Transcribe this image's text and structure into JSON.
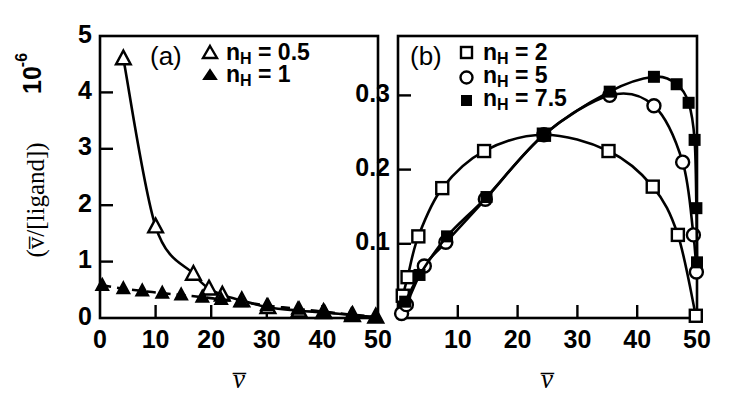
{
  "figure": {
    "background": "#ffffff",
    "ink_color": "#000000",
    "width": 733,
    "height": 418
  },
  "shared": {
    "xlabel": "v̅",
    "ylabel_main": "(v̅/[ligand])",
    "ylabel_exponent_base": "10",
    "ylabel_exponent_power": "-6",
    "nh_symbol_base": "n",
    "nh_symbol_sub": "H",
    "equals": "="
  },
  "chart_data": [
    {
      "type": "scatter",
      "panel": "a",
      "panel_label": "(a)",
      "title": "",
      "xlabel": "v̅",
      "ylabel": "(v̅/[ligand]) 10⁻⁶",
      "xlim": [
        0,
        50
      ],
      "ylim": [
        0,
        5
      ],
      "xticks": [
        0,
        10,
        20,
        30,
        40,
        50
      ],
      "xticklabels": [
        "0",
        "10",
        "20",
        "30",
        "40",
        "50"
      ],
      "yticks": [
        0,
        1,
        2,
        3,
        4,
        5
      ],
      "yticklabels": [
        "0",
        "1",
        "2",
        "3",
        "4",
        "5"
      ],
      "grid": false,
      "legend_position": "top-center",
      "series": [
        {
          "name": "n_H = 0.5",
          "legend_label": "n_H = 0.5",
          "nh_value": "0.5",
          "marker": "triangle-open",
          "line": "solid",
          "points": [
            {
              "x": 4.2,
              "y": 4.6
            },
            {
              "x": 10.0,
              "y": 1.62
            },
            {
              "x": 16.8,
              "y": 0.78
            },
            {
              "x": 19.6,
              "y": 0.52
            },
            {
              "x": 22.0,
              "y": 0.41
            },
            {
              "x": 25.5,
              "y": 0.31
            },
            {
              "x": 30.2,
              "y": 0.19
            },
            {
              "x": 35.8,
              "y": 0.13
            },
            {
              "x": 40.2,
              "y": 0.1
            },
            {
              "x": 45.4,
              "y": 0.05
            },
            {
              "x": 49.6,
              "y": 0.02
            }
          ]
        },
        {
          "name": "n_H = 1",
          "legend_label": "n_H = 1",
          "nh_value": "1",
          "marker": "triangle-filled",
          "line": "dashed",
          "points": [
            {
              "x": 0.4,
              "y": 0.58
            },
            {
              "x": 4.2,
              "y": 0.52
            },
            {
              "x": 7.6,
              "y": 0.48
            },
            {
              "x": 11.2,
              "y": 0.44
            },
            {
              "x": 14.6,
              "y": 0.41
            },
            {
              "x": 18.4,
              "y": 0.37
            },
            {
              "x": 21.8,
              "y": 0.33
            },
            {
              "x": 25.4,
              "y": 0.29
            },
            {
              "x": 30.0,
              "y": 0.22
            },
            {
              "x": 35.6,
              "y": 0.16
            },
            {
              "x": 40.4,
              "y": 0.11
            },
            {
              "x": 45.2,
              "y": 0.06
            },
            {
              "x": 49.6,
              "y": 0.02
            }
          ]
        }
      ]
    },
    {
      "type": "scatter",
      "panel": "b",
      "panel_label": "(b)",
      "title": "",
      "xlabel": "v̅",
      "ylabel": "(v̅/[ligand]) 10⁻⁶",
      "xlim": [
        0,
        50
      ],
      "ylim": [
        0,
        0.38
      ],
      "xticks": [
        0,
        10,
        20,
        30,
        40,
        50
      ],
      "xticklabels": [
        "0",
        "10",
        "20",
        "30",
        "40",
        "50"
      ],
      "yticks": [
        0.1,
        0.2,
        0.3
      ],
      "yticklabels": [
        "0.1",
        "0.2",
        "0.3"
      ],
      "grid": false,
      "legend_position": "top-left",
      "series": [
        {
          "name": "n_H = 2",
          "legend_label": "n_H = 2",
          "nh_value": "2",
          "marker": "square-open",
          "line": "solid",
          "points": [
            {
              "x": 0.8,
              "y": 0.03
            },
            {
              "x": 1.6,
              "y": 0.055
            },
            {
              "x": 3.4,
              "y": 0.11
            },
            {
              "x": 7.4,
              "y": 0.175
            },
            {
              "x": 14.4,
              "y": 0.225
            },
            {
              "x": 24.4,
              "y": 0.247
            },
            {
              "x": 35.2,
              "y": 0.225
            },
            {
              "x": 42.6,
              "y": 0.177
            },
            {
              "x": 46.8,
              "y": 0.112
            },
            {
              "x": 49.8,
              "y": 0.003
            }
          ]
        },
        {
          "name": "n_H = 5",
          "legend_label": "n_H = 5",
          "nh_value": "5",
          "marker": "circle-open",
          "line": "solid",
          "points": [
            {
              "x": 0.6,
              "y": 0.006
            },
            {
              "x": 1.4,
              "y": 0.018
            },
            {
              "x": 4.4,
              "y": 0.07
            },
            {
              "x": 8.0,
              "y": 0.102
            },
            {
              "x": 14.6,
              "y": 0.16
            },
            {
              "x": 24.4,
              "y": 0.247
            },
            {
              "x": 35.4,
              "y": 0.3
            },
            {
              "x": 42.8,
              "y": 0.286
            },
            {
              "x": 47.6,
              "y": 0.21
            },
            {
              "x": 49.4,
              "y": 0.112
            },
            {
              "x": 49.9,
              "y": 0.062
            }
          ]
        },
        {
          "name": "n_H = 7.5",
          "legend_label": "n_H = 7.5",
          "nh_value": "7.5",
          "marker": "square-filled",
          "line": "solid",
          "points": [
            {
              "x": 1.2,
              "y": 0.022
            },
            {
              "x": 3.6,
              "y": 0.058
            },
            {
              "x": 8.2,
              "y": 0.11
            },
            {
              "x": 14.8,
              "y": 0.163
            },
            {
              "x": 24.4,
              "y": 0.247
            },
            {
              "x": 35.4,
              "y": 0.305
            },
            {
              "x": 42.8,
              "y": 0.325
            },
            {
              "x": 46.6,
              "y": 0.315
            },
            {
              "x": 48.6,
              "y": 0.29
            },
            {
              "x": 49.6,
              "y": 0.24
            },
            {
              "x": 49.9,
              "y": 0.148
            },
            {
              "x": 50.0,
              "y": 0.075
            }
          ]
        }
      ]
    }
  ]
}
